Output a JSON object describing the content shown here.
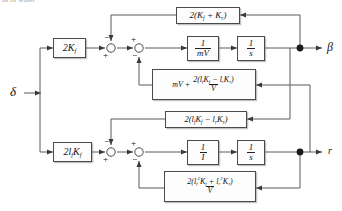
{
  "caption_fragment": "as of water",
  "diagram": {
    "input": {
      "label": "δ",
      "name": "steering-input"
    },
    "outputs": [
      {
        "label": "β",
        "name": "sideslip-output"
      },
      {
        "label": "r",
        "name": "yaw-rate-output"
      }
    ],
    "blocks": [
      {
        "id": "gain_front",
        "name": "gain-2kf",
        "text": "2K_f"
      },
      {
        "id": "gain_front_moment",
        "name": "gain-2lfkf",
        "text": "2l_f K_f"
      },
      {
        "id": "plant_mv",
        "name": "plant-one-over-mv",
        "num": "1",
        "den": "mV"
      },
      {
        "id": "int_beta",
        "name": "integrator-beta",
        "num": "1",
        "den": "s"
      },
      {
        "id": "plant_i",
        "name": "plant-one-over-i",
        "num": "1",
        "den": "I"
      },
      {
        "id": "int_r",
        "name": "integrator-r",
        "num": "1",
        "den": "s"
      },
      {
        "id": "fb_top",
        "name": "feedback-2kf-plus-kr",
        "text": "2(K_f + K_r)"
      },
      {
        "id": "fb_mv_mix",
        "name": "feedback-mv-plus-term",
        "lead": "mV +",
        "num": "2(l_f K_f − l_r K_r)",
        "den": "V"
      },
      {
        "id": "fb_cross",
        "name": "feedback-2lfkf-minus-lrkr",
        "text": "2(l_f K_f − l_r K_r)"
      },
      {
        "id": "fb_bottom",
        "name": "feedback-squared-term",
        "num": "2(l_f² K_f + l_r² K_r)",
        "den": "V"
      }
    ],
    "summing_junctions": [
      {
        "name": "sum-beta-1",
        "signs": {
          "top": "−",
          "bottom": "+"
        }
      },
      {
        "name": "sum-beta-2",
        "signs": {
          "top": "+",
          "bottom": "−"
        }
      },
      {
        "name": "sum-r-1",
        "signs": {
          "top": "−",
          "bottom": "+"
        }
      },
      {
        "name": "sum-r-2",
        "signs": {
          "top": "+",
          "bottom": "−"
        }
      }
    ],
    "colors": {
      "line": "#4a4a4a",
      "block_border": "#4a4a4a",
      "text": "#111111",
      "background": "#ffffff"
    }
  }
}
